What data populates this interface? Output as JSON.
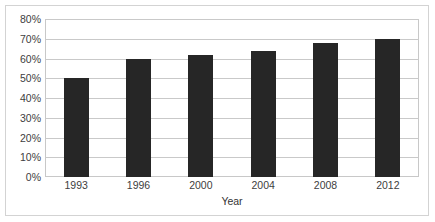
{
  "chart": {
    "title_sliver": "",
    "axis_title_x": "Year",
    "axis_title_y": "",
    "bar_color": "#262626",
    "gridline_color": "#c9c9c9",
    "frame_color": "#d3d3d3",
    "plot_border_color": "#c8c8c8"
  },
  "chart_data": {
    "type": "bar",
    "title": "",
    "xlabel": "Year",
    "ylabel": "",
    "categories": [
      "1993",
      "1996",
      "2000",
      "2004",
      "2008",
      "2012"
    ],
    "values": [
      50,
      60,
      62,
      64,
      68,
      70
    ],
    "value_labels": [
      "50%",
      "60%",
      "62%",
      "64%",
      "68%",
      "70%"
    ],
    "ylim": [
      0,
      80
    ],
    "ytick_values": [
      80,
      70,
      60,
      50,
      40,
      30,
      20,
      10,
      0
    ],
    "ytick_labels": [
      "80%",
      "70%",
      "60%",
      "50%",
      "40%",
      "30%",
      "20%",
      "10%",
      "0%"
    ],
    "grid": true,
    "grid_axis": "y",
    "legend": false,
    "legend_position": "none",
    "series": [
      {
        "name": "",
        "values": [
          50,
          60,
          62,
          64,
          68,
          70
        ]
      }
    ]
  }
}
